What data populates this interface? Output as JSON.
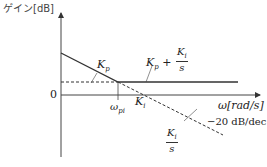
{
  "diagram": {
    "y_axis_label": "ゲイン[dB]",
    "x_axis_label": "ω[rad/s]",
    "zero_label": "0",
    "break_freq_label": "ω",
    "break_freq_sub": "pi",
    "labels": {
      "kp": "K",
      "kp_sub": "p",
      "ki": "K",
      "ki_sub": "i",
      "sum_kp": "K",
      "sum_kp_sub": "p",
      "plus": " + ",
      "sum_frac_num": "K",
      "sum_frac_num_sub": "i",
      "sum_frac_den": "s",
      "int_frac_num": "K",
      "int_frac_num_sub": "i",
      "int_frac_den": "s",
      "slope": "−20 dB/dec"
    },
    "colors": {
      "line": "#333333",
      "axis": "#444444"
    }
  }
}
